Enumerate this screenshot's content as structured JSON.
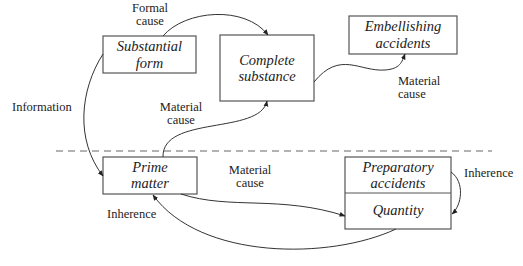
{
  "nodes": {
    "substantial_form": {
      "line1": "Substantial",
      "line2": "form"
    },
    "complete_substance": {
      "line1": "Complete",
      "line2": "substance"
    },
    "embellishing_accidents": {
      "line1": "Embellishing",
      "line2": "accidents"
    },
    "prime_matter": {
      "line1": "Prime",
      "line2": "matter"
    },
    "preparatory_accidents": {
      "line1": "Preparatory",
      "line2": "accidents"
    },
    "quantity": {
      "line1": "Quantity"
    }
  },
  "labels": {
    "formal_cause": {
      "line1": "Formal",
      "line2": "cause"
    },
    "information": {
      "line1": "Information"
    },
    "material_cause_upper": {
      "line1": "Material",
      "line2": "cause"
    },
    "material_cause_right": {
      "line1": "Material",
      "line2": "cause"
    },
    "material_cause_lower": {
      "line1": "Material",
      "line2": "cause"
    },
    "inherence_left": {
      "line1": "Inherence"
    },
    "inherence_right": {
      "line1": "Inherence"
    }
  }
}
